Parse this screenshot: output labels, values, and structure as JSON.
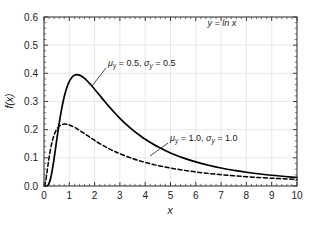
{
  "chart_data": {
    "type": "line",
    "title": "",
    "xlabel": "x",
    "ylabel": "f(x)",
    "xlim": [
      0,
      10
    ],
    "ylim": [
      0,
      0.6
    ],
    "grid": true,
    "legend_position": "inline-annotations",
    "xticks": [
      "0",
      "1",
      "2",
      "3",
      "4",
      "5",
      "6",
      "7",
      "8",
      "9",
      "10"
    ],
    "yticks": [
      "0.0",
      "0.1",
      "0.2",
      "0.3",
      "0.4",
      "0.5",
      "0.6"
    ],
    "x_minor_ticks_per_interval": 5,
    "y_minor_ticks_per_interval": 5,
    "annotations": [
      {
        "id": "transform-note",
        "text": "y = ln x",
        "mu": "",
        "sigma": "",
        "x_px": 222,
        "y_px": 26
      }
    ],
    "series": [
      {
        "name": "mu_y = 0.5, sigma_y = 0.5",
        "label_mu": "μ",
        "label_mu_sub": "y",
        "label_mu_value": " = 0.5,  ",
        "label_sigma": "σ",
        "label_sigma_sub": "y",
        "label_sigma_value": " = 0.5",
        "style": "solid",
        "color": "#000000",
        "width": 1.7,
        "mu": 0.5,
        "sigma": 0.5,
        "peak_x": 1.28,
        "peak_y": 0.548,
        "label_x_px": 108,
        "label_y_px": 66,
        "leader": [
          92,
          86,
          106,
          68
        ],
        "x": [
          0.02,
          0.05,
          0.1,
          0.15,
          0.2,
          0.25,
          0.3,
          0.35,
          0.4,
          0.45,
          0.5,
          0.6,
          0.7,
          0.8,
          0.9,
          1.0,
          1.1,
          1.2,
          1.3,
          1.4,
          1.5,
          1.6,
          1.7,
          1.8,
          1.9,
          2.0,
          2.2,
          2.4,
          2.6,
          2.8,
          3.0,
          3.25,
          3.5,
          3.75,
          4.0,
          4.5,
          5.0,
          5.5,
          6.0,
          6.5,
          7.0,
          7.5,
          8.0,
          9.0,
          10.0
        ],
        "y": [
          0.0,
          0.0,
          0.0002,
          0.0024,
          0.0093,
          0.0228,
          0.0429,
          0.0686,
          0.0982,
          0.1297,
          0.1617,
          0.2225,
          0.2749,
          0.3171,
          0.349,
          0.3713,
          0.3854,
          0.3929,
          0.3952,
          0.3935,
          0.3888,
          0.382,
          0.3736,
          0.3642,
          0.3541,
          0.3436,
          0.3219,
          0.3002,
          0.2792,
          0.2592,
          0.2404,
          0.2188,
          0.1993,
          0.1818,
          0.166,
          0.1391,
          0.1174,
          0.0999,
          0.0856,
          0.0738,
          0.064,
          0.0558,
          0.0489,
          0.0381,
          0.0303
        ]
      },
      {
        "name": "mu_y = 1.0, sigma_y = 1.0",
        "label_mu": "μ",
        "label_mu_sub": "y",
        "label_mu_value": " = 1.0,  ",
        "label_sigma": "σ",
        "label_sigma_sub": "y",
        "label_sigma_value": " = 1.0",
        "style": "dashed",
        "color": "#000000",
        "width": 1.5,
        "mu": 1.0,
        "sigma": 1.0,
        "peak_x": 1.0,
        "peak_y": 0.242,
        "label_x_px": 170,
        "label_y_px": 141,
        "leader": [
          150,
          156,
          168,
          143
        ],
        "x": [
          0.02,
          0.05,
          0.1,
          0.15,
          0.2,
          0.3,
          0.4,
          0.5,
          0.6,
          0.7,
          0.8,
          0.9,
          1.0,
          1.2,
          1.4,
          1.6,
          1.8,
          2.0,
          2.25,
          2.5,
          2.75,
          3.0,
          3.5,
          4.0,
          4.5,
          5.0,
          5.5,
          6.0,
          6.5,
          7.0,
          7.5,
          8.0,
          8.5,
          9.0,
          9.5,
          10.0
        ],
        "y": [
          0.0006,
          0.0084,
          0.0372,
          0.07,
          0.1009,
          0.1496,
          0.1813,
          0.2009,
          0.2121,
          0.2177,
          0.2197,
          0.219,
          0.2167,
          0.2086,
          0.1977,
          0.1858,
          0.1737,
          0.162,
          0.1483,
          0.1358,
          0.1245,
          0.1144,
          0.0975,
          0.0838,
          0.0727,
          0.0637,
          0.0562,
          0.05,
          0.0447,
          0.0402,
          0.0363,
          0.033,
          0.0301,
          0.0275,
          0.0253,
          0.0233
        ]
      }
    ]
  },
  "plot_geometry": {
    "left_px": 44,
    "right_px": 297,
    "top_px": 17,
    "bottom_px": 186,
    "frame_color": "#3a3a3a",
    "grid_color": "#dcdcdc",
    "background": "#ffffff"
  }
}
